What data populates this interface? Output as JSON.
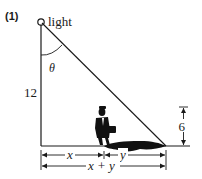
{
  "problem_number": "(1)",
  "labels": {
    "light": "light",
    "angle": "θ",
    "pole_height": "12",
    "person_height": "6",
    "distance_x": "x",
    "shadow_y": "y",
    "total": "x + y"
  },
  "colors": {
    "ink": "#1a1a1a",
    "background": "#ffffff"
  }
}
